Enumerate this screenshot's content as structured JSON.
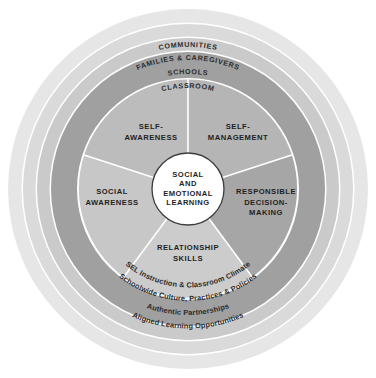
{
  "diagram": {
    "center": {
      "lines": [
        "SOCIAL",
        "AND",
        "EMOTIONAL",
        "LEARNING"
      ],
      "fill": "#ffffff",
      "stroke": "#3a3a3a"
    },
    "competencies": [
      {
        "id": "self-awareness",
        "lines": [
          "SELF-",
          "AWARENESS"
        ],
        "fill": "#b9b9b9"
      },
      {
        "id": "self-management",
        "lines": [
          "SELF-",
          "MANAGEMENT"
        ],
        "fill": "#b2b2b2"
      },
      {
        "id": "responsible-decision-making",
        "lines": [
          "RESPONSIBLE",
          "DECISION-",
          "MAKING"
        ],
        "fill": "#a3a3a3"
      },
      {
        "id": "relationship-skills",
        "lines": [
          "RELATIONSHIP",
          "SKILLS"
        ],
        "fill": "#c9c9c9"
      },
      {
        "id": "social-awareness",
        "lines": [
          "SOCIAL",
          "AWARENESS"
        ],
        "fill": "#c4c4c4"
      }
    ],
    "rings": [
      {
        "id": "classroom",
        "label": "CLASSROOM",
        "fill": "#9d9d9d",
        "style": "caps"
      },
      {
        "id": "schools",
        "label": "SCHOOLS",
        "fill": "#c6c6c6",
        "style": "caps"
      },
      {
        "id": "families",
        "label": "FAMILIES & CAREGIVERS",
        "fill": "#d7d7d7",
        "style": "caps"
      },
      {
        "id": "communities",
        "label": "COMMUNITIES",
        "fill": "#e4e4e4",
        "style": "caps"
      }
    ],
    "practices": [
      {
        "id": "sel-instruction",
        "label": "SEL Instruction & Classroom Climate",
        "ring": "classroom"
      },
      {
        "id": "schoolwide-culture",
        "label": "Schoolwide Culture, Practices & Policies",
        "ring": "schools"
      },
      {
        "id": "authentic-partnerships",
        "label": "Authentic Partnerships",
        "ring": "families"
      },
      {
        "id": "aligned-learning",
        "label": "Aligned Learning Opportunities",
        "ring": "communities"
      }
    ],
    "colors": {
      "background": "#ffffff",
      "divider": "#ffffff",
      "text": "#2b2b2b"
    }
  }
}
